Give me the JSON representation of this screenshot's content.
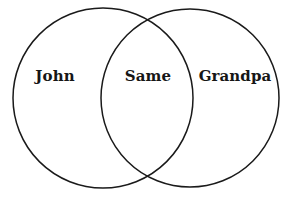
{
  "diagram": {
    "type": "venn-two-set",
    "title": "",
    "background_color": "#ffffff",
    "stroke_color": "#1a1a1a",
    "stroke_width": 1.5,
    "text_color": "#161616",
    "circles": [
      {
        "name": "left-set",
        "cx": 103,
        "cy": 98,
        "r": 90,
        "fill": "none"
      },
      {
        "name": "right-set",
        "cx": 190,
        "cy": 98,
        "r": 89,
        "fill": "none"
      }
    ],
    "labels": {
      "left": "John",
      "center": "Same",
      "right": "Grandpa"
    },
    "label_positions": {
      "left": {
        "x": 55,
        "y": 76
      },
      "center": {
        "x": 148,
        "y": 76
      },
      "right": {
        "x": 235,
        "y": 76
      }
    }
  }
}
